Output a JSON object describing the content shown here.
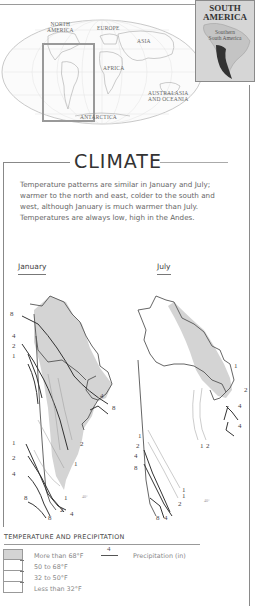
{
  "world_map": {
    "labels": {
      "north_america": "NORTH AMERICA",
      "north_america_line1": "NORTH",
      "north_america_line2": "AMERICA",
      "europe": "EUROPE",
      "asia": "ASIA",
      "africa": "AFRICA",
      "australasia_line1": "AUSTRALASIA",
      "australasia_line2": "AND OCEANIA",
      "antarctica": "ANTARCTICA"
    }
  },
  "inset": {
    "title_line1": "SOUTH",
    "title_line2": "AMERICA",
    "subtitle_line1": "Southern",
    "subtitle_line2": "South America"
  },
  "climate": {
    "title": "CLIMATE",
    "description": "Temperature patterns are similar in January and July; warmer to the north and east, colder to the south and west, although January is much warmer than July. Temperatures are always low, high in the Andes."
  },
  "maps": {
    "january": {
      "label": "January",
      "isohyet_labels_left": [
        "8",
        "4",
        "2",
        "1"
      ],
      "isohyet_labels_right": [
        "8",
        "4"
      ],
      "isohyet_labels_south": [
        "1",
        "2",
        "4",
        "8",
        "2",
        "1",
        "1",
        "2",
        "8",
        "4"
      ],
      "latitude_label": "40°"
    },
    "july": {
      "label": "July",
      "isohyet_labels_right": [
        "1",
        "2",
        "4",
        "4"
      ],
      "isohyet_labels_south": [
        "1",
        "2",
        "4",
        "8",
        "1",
        "2",
        "1",
        "2",
        "8",
        "4"
      ],
      "latitude_label": "40°"
    }
  },
  "legend": {
    "title": "TEMPERATURE AND PRECIPITATION",
    "temperature": [
      {
        "label": "More than 68°F",
        "fill": "#d4d4d4"
      },
      {
        "label": "50 to 68°F",
        "fill": "#ffffff"
      },
      {
        "label": "32 to 50°F",
        "fill": "#ffffff"
      },
      {
        "label": "Less than 32°F",
        "fill": "#ffffff"
      }
    ],
    "precipitation": {
      "sample_value": "4",
      "label": "Precipitation (in)"
    }
  },
  "colors": {
    "warm_shade": "#d4d4d4",
    "line": "#444444",
    "frame": "#8a8a8a"
  }
}
